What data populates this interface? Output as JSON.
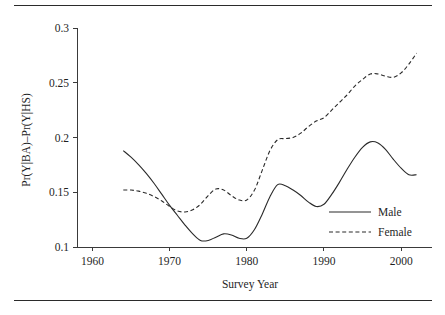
{
  "figure": {
    "top_rule": "horizontal-rule",
    "bottom_rule": "horizontal-rule"
  },
  "chart_data": {
    "type": "line",
    "title": "",
    "xlabel": "Survey Year",
    "ylabel": "Pr(Y|BA)–Pr(Y|HS)",
    "xlim": [
      1958,
      2004
    ],
    "ylim": [
      0.1,
      0.3
    ],
    "xticks": [
      1960,
      1970,
      1980,
      1990,
      2000
    ],
    "xtick_labels": [
      "1960",
      "1970",
      "1980",
      "1990",
      "2000"
    ],
    "yticks": [
      0.1,
      0.15,
      0.2,
      0.25,
      0.3
    ],
    "ytick_labels": [
      "0.1",
      "0.15",
      "0.2",
      "0.25",
      "0.3"
    ],
    "grid": false,
    "legend_position": "lower-right-inside",
    "series": [
      {
        "name": "Male",
        "style": "solid",
        "color": "#2a2a2a",
        "x": [
          1964,
          1965,
          1966,
          1967,
          1968,
          1969,
          1970,
          1971,
          1972,
          1973,
          1974,
          1975,
          1976,
          1977,
          1978,
          1979,
          1980,
          1981,
          1982,
          1983,
          1984,
          1985,
          1986,
          1987,
          1988,
          1989,
          1990,
          1991,
          1992,
          1993,
          1994,
          1995,
          1996,
          1997,
          1998,
          1999,
          2000,
          2001,
          2002
        ],
        "values": [
          0.188,
          0.182,
          0.175,
          0.167,
          0.158,
          0.148,
          0.138,
          0.129,
          0.12,
          0.112,
          0.106,
          0.106,
          0.109,
          0.112,
          0.111,
          0.108,
          0.108,
          0.116,
          0.13,
          0.146,
          0.157,
          0.156,
          0.152,
          0.147,
          0.141,
          0.137,
          0.139,
          0.148,
          0.159,
          0.171,
          0.182,
          0.191,
          0.196,
          0.195,
          0.189,
          0.18,
          0.172,
          0.166,
          0.166
        ]
      },
      {
        "name": "Female",
        "style": "dashed",
        "color": "#2a2a2a",
        "x": [
          1964,
          1965,
          1966,
          1967,
          1968,
          1969,
          1970,
          1971,
          1972,
          1973,
          1974,
          1975,
          1976,
          1977,
          1978,
          1979,
          1980,
          1981,
          1982,
          1983,
          1984,
          1985,
          1986,
          1987,
          1988,
          1989,
          1990,
          1991,
          1992,
          1993,
          1994,
          1995,
          1996,
          1997,
          1998,
          1999,
          2000,
          2001,
          2002
        ],
        "values": [
          0.152,
          0.152,
          0.151,
          0.149,
          0.146,
          0.142,
          0.137,
          0.133,
          0.132,
          0.134,
          0.139,
          0.147,
          0.153,
          0.152,
          0.147,
          0.143,
          0.143,
          0.152,
          0.17,
          0.188,
          0.198,
          0.199,
          0.2,
          0.204,
          0.21,
          0.215,
          0.218,
          0.225,
          0.232,
          0.239,
          0.247,
          0.253,
          0.258,
          0.258,
          0.256,
          0.255,
          0.259,
          0.267,
          0.277
        ]
      }
    ],
    "legend_entries": [
      {
        "label": "Male",
        "style": "solid"
      },
      {
        "label": "Female",
        "style": "dashed"
      }
    ]
  }
}
